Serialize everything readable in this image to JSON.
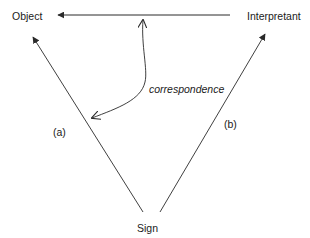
{
  "diagram": {
    "type": "semiotic-triangle",
    "nodes": {
      "object": "Object",
      "interpretant": "Interpretant",
      "sign": "Sign"
    },
    "edges": {
      "interpretant_to_object": "",
      "sign_to_object": "(a)",
      "sign_to_interpretant": "(b)",
      "correspondence": "correspondence"
    },
    "colors": {
      "line": "#2a2a2a",
      "text": "#1a1a1a",
      "background": "#ffffff"
    }
  }
}
